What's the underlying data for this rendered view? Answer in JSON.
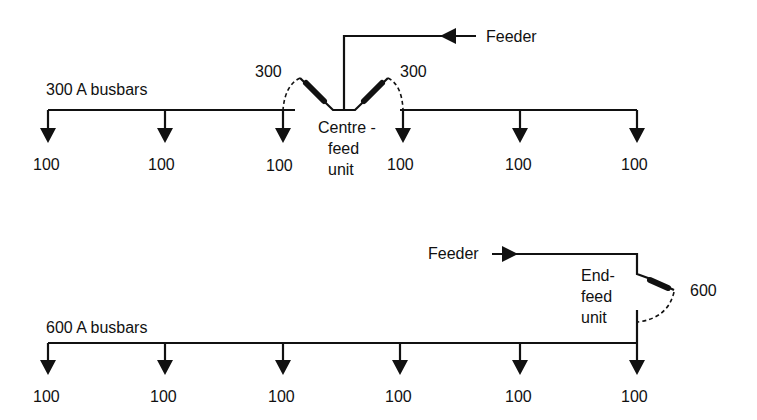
{
  "top_diagram": {
    "busbar_label": "300 A busbars",
    "feeder_label": "Feeder",
    "left_fuse_rating": "300",
    "right_fuse_rating": "300",
    "unit_label_line1": "Centre -",
    "unit_label_line2": "feed",
    "unit_label_line3": "unit",
    "loads": [
      "100",
      "100",
      "100",
      "100",
      "100",
      "100"
    ]
  },
  "bottom_diagram": {
    "busbar_label": "600 A busbars",
    "feeder_label": "Feeder",
    "fuse_rating": "600",
    "unit_label_line1": "End-",
    "unit_label_line2": "feed",
    "unit_label_line3": "unit",
    "loads": [
      "100",
      "100",
      "100",
      "100",
      "100",
      "100"
    ]
  },
  "colors": {
    "ink": "#111111",
    "background": "#ffffff"
  }
}
